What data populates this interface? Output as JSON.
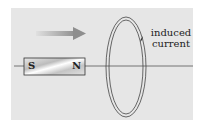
{
  "diagram": {
    "magnet": {
      "south_label": "S",
      "north_label": "N"
    },
    "annotation": {
      "line1": "induced",
      "line2": "current"
    },
    "motion_arrow": "right-arrow",
    "colors": {
      "background": "#e6e6e6",
      "arrow": "#9a9a9a",
      "line": "#444444"
    }
  }
}
